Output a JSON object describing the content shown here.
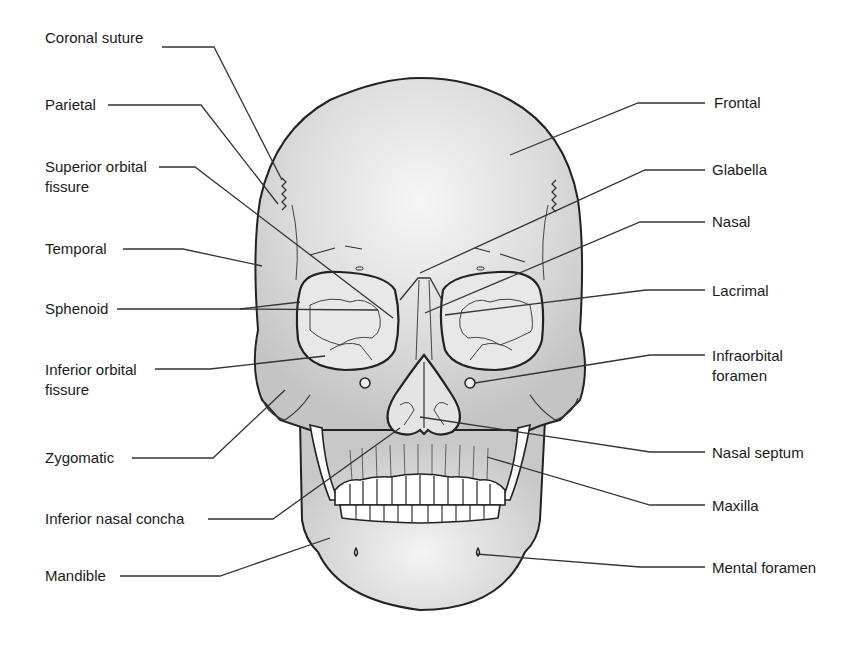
{
  "diagram": {
    "colors": {
      "bone_fill": "#d2d2d2",
      "bone_highlight": "#f4f4f4",
      "outline": "#222222",
      "leader_line": "#333333",
      "text": "#1a1a1a",
      "background": "#ffffff"
    },
    "left_labels": [
      {
        "id": "coronal-suture",
        "text": "Coronal suture",
        "x": 45,
        "y": 38
      },
      {
        "id": "parietal",
        "text": "Parietal",
        "x": 45,
        "y": 96
      },
      {
        "id": "superior-orbital-fissure",
        "text": "Superior orbital\nfissure",
        "x": 45,
        "y": 158
      },
      {
        "id": "temporal",
        "text": "Temporal",
        "x": 45,
        "y": 240
      },
      {
        "id": "sphenoid",
        "text": "Sphenoid",
        "x": 45,
        "y": 300
      },
      {
        "id": "inferior-orbital-fissure",
        "text": "Inferior orbital\nfissure",
        "x": 45,
        "y": 362
      },
      {
        "id": "zygomatic",
        "text": "Zygomatic",
        "x": 45,
        "y": 448
      },
      {
        "id": "inferior-nasal-concha",
        "text": "Inferior nasal concha",
        "x": 45,
        "y": 508
      },
      {
        "id": "mandible",
        "text": "Mandible",
        "x": 45,
        "y": 566
      }
    ],
    "right_labels": [
      {
        "id": "frontal",
        "text": "Frontal",
        "x": 714,
        "y": 94
      },
      {
        "id": "glabella",
        "text": "Glabella",
        "x": 712,
        "y": 160
      },
      {
        "id": "nasal",
        "text": "Nasal",
        "x": 712,
        "y": 212
      },
      {
        "id": "lacrimal",
        "text": "Lacrimal",
        "x": 712,
        "y": 283
      },
      {
        "id": "infraorbital-foramen",
        "text": "Infraorbital\nforamen",
        "x": 712,
        "y": 347
      },
      {
        "id": "nasal-septum",
        "text": "Nasal septum",
        "x": 712,
        "y": 445
      },
      {
        "id": "maxilla",
        "text": "Maxilla",
        "x": 712,
        "y": 498
      },
      {
        "id": "mental-foramen",
        "text": "Mental foramen",
        "x": 712,
        "y": 560
      }
    ],
    "leader_lines": [
      {
        "id": "coronal-suture",
        "points": "162,47 214,47 282,180"
      },
      {
        "id": "parietal",
        "points": "108,105 201,105 278,204"
      },
      {
        "id": "superior-orbital-fissure",
        "points": "159,167 195,167 393,318"
      },
      {
        "id": "temporal",
        "points": "123,249 183,249 262,266"
      },
      {
        "id": "sphenoid",
        "points": "117,309 240,309 378,310"
      },
      {
        "id": "sphenoid-2",
        "points": "240,309 300,302"
      },
      {
        "id": "inferior-orbital-fissure",
        "points": "155,369 210,369 325,356"
      },
      {
        "id": "zygomatic",
        "points": "132,458 213,458 285,390"
      },
      {
        "id": "inferior-nasal-concha",
        "points": "208,519 273,519 400,428"
      },
      {
        "id": "mandible",
        "points": "120,576 220,576 330,538"
      },
      {
        "id": "frontal",
        "points": "705,103 638,103 510,155"
      },
      {
        "id": "glabella",
        "points": "705,170 645,170 420,273"
      },
      {
        "id": "nasal",
        "points": "705,222 640,222 425,313"
      },
      {
        "id": "lacrimal",
        "points": "705,290 646,290 445,315"
      },
      {
        "id": "infraorbital-foramen",
        "points": "705,355 650,355 475,383"
      },
      {
        "id": "nasal-septum",
        "points": "705,452 650,452 420,417"
      },
      {
        "id": "maxilla",
        "points": "705,505 650,505 487,457"
      },
      {
        "id": "mental-foramen",
        "points": "705,567 640,567 476,554"
      }
    ]
  }
}
